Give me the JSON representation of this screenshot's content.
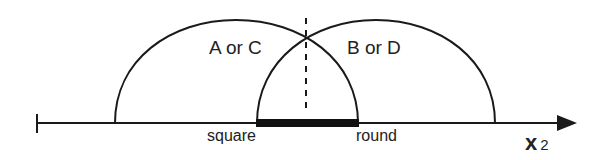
{
  "diagram": {
    "regions": [
      {
        "label": "A or C",
        "arc": "left"
      },
      {
        "label": "B or D",
        "arc": "right"
      }
    ],
    "axis": {
      "label_main": "x",
      "label_sub": "2"
    },
    "endpoints": {
      "left": "square",
      "right": "round"
    }
  }
}
